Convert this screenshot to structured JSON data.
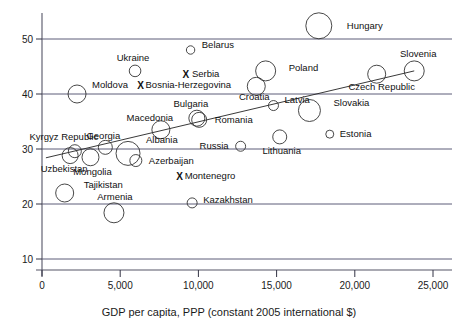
{
  "chart_data": {
    "type": "scatter",
    "title": "",
    "xlabel": "GDP per capita, PPP (constant 2005 international $)",
    "ylabel": "",
    "xlim": [
      0,
      25600
    ],
    "ylim": [
      8,
      54
    ],
    "grid": true,
    "legend": "none",
    "marker_encoding": "bubble size = third variable; X = no size value",
    "xticks": [
      "0",
      "5,000",
      "10,000",
      "15,000",
      "20,000",
      "25,000"
    ],
    "xtick_values": [
      0,
      5000,
      10000,
      15000,
      20000,
      25000
    ],
    "yticks": [
      "10",
      "20",
      "30",
      "40",
      "50"
    ],
    "ytick_values": [
      10,
      20,
      30,
      40,
      50
    ],
    "trendline": {
      "x0": 250,
      "y0": 28.4,
      "x1": 23800,
      "y1": 44.2
    },
    "points": [
      {
        "name": "Hungary",
        "x": 17700,
        "y": 52.4,
        "r": 13.0,
        "marker": "circle",
        "label_dx": 15,
        "label_dy": 3,
        "anchor": "start"
      },
      {
        "name": "Belarus",
        "x": 9500,
        "y": 48.0,
        "r": 4.2,
        "marker": "circle",
        "label_dx": 7,
        "label_dy": -2,
        "anchor": "start"
      },
      {
        "name": "Ukraine",
        "x": 5950,
        "y": 44.2,
        "r": 5.8,
        "marker": "circle",
        "label_dx": -2,
        "label_dy": -10,
        "anchor": "middle"
      },
      {
        "name": "Slovenia",
        "x": 23800,
        "y": 44.2,
        "r": 10.0,
        "marker": "circle",
        "label_dx": 4,
        "label_dy": -14,
        "anchor": "middle"
      },
      {
        "name": "Serbia",
        "x": 9200,
        "y": 43.5,
        "r": 0,
        "marker": "x",
        "label_dx": 6,
        "label_dy": 2,
        "anchor": "start"
      },
      {
        "name": "Poland",
        "x": 14300,
        "y": 44.2,
        "r": 10.0,
        "marker": "circle",
        "label_dx": 13,
        "label_dy": 0,
        "anchor": "start"
      },
      {
        "name": "Czech Republic",
        "x": 21400,
        "y": 43.6,
        "r": 9.0,
        "marker": "circle",
        "label_dx": 5,
        "label_dy": 16,
        "anchor": "middle"
      },
      {
        "name": "Bosnia-Herzegovina",
        "x": 6300,
        "y": 41.6,
        "r": 0,
        "marker": "x",
        "label_dx": 5,
        "label_dy": 3,
        "anchor": "start"
      },
      {
        "name": "Croatia",
        "x": 13700,
        "y": 41.4,
        "r": 9.0,
        "marker": "circle",
        "label_dx": -2,
        "label_dy": 14,
        "anchor": "middle"
      },
      {
        "name": "Moldova",
        "x": 2240,
        "y": 40.0,
        "r": 9.0,
        "marker": "circle",
        "label_dx": 6,
        "label_dy": -6,
        "anchor": "start"
      },
      {
        "name": "Latvia",
        "x": 14800,
        "y": 37.9,
        "r": 5.0,
        "marker": "circle",
        "label_dx": 6,
        "label_dy": -3,
        "anchor": "start"
      },
      {
        "name": "Slovakia",
        "x": 17100,
        "y": 37.0,
        "r": 11.0,
        "marker": "circle",
        "label_dx": 13,
        "label_dy": -5,
        "anchor": "start"
      },
      {
        "name": "Bulgaria",
        "x": 9900,
        "y": 35.6,
        "r": 8.0,
        "marker": "circle",
        "label_dx": -6,
        "label_dy": -11,
        "anchor": "middle"
      },
      {
        "name": "Romania",
        "x": 10050,
        "y": 35.3,
        "r": 7.5,
        "marker": "circle",
        "label_dx": 8,
        "label_dy": 3,
        "anchor": "start"
      },
      {
        "name": "Macedonia",
        "x": 7600,
        "y": 33.5,
        "r": 9.0,
        "marker": "circle",
        "label_dx": -11,
        "label_dy": -9,
        "anchor": "middle"
      },
      {
        "name": "Estonia",
        "x": 18400,
        "y": 32.7,
        "r": 4.0,
        "marker": "circle",
        "label_dx": 6,
        "label_dy": 3,
        "anchor": "start"
      },
      {
        "name": "Lithuania",
        "x": 15200,
        "y": 32.2,
        "r": 7.0,
        "marker": "circle",
        "label_dx": 2,
        "label_dy": 17,
        "anchor": "middle"
      },
      {
        "name": "Russia",
        "x": 12700,
        "y": 30.5,
        "r": 5.0,
        "marker": "circle",
        "label_dx": -7,
        "label_dy": 3,
        "anchor": "end"
      },
      {
        "name": "Georgia",
        "x": 4050,
        "y": 30.3,
        "r": 7.0,
        "marker": "circle",
        "label_dx": -2,
        "label_dy": -8,
        "anchor": "middle"
      },
      {
        "name": "Kyrgyz Republic",
        "x": 2100,
        "y": 29.6,
        "r": 6.5,
        "marker": "circle",
        "label_dx": -11,
        "label_dy": -11,
        "anchor": "middle"
      },
      {
        "name": "Albania",
        "x": 5500,
        "y": 29.2,
        "r": 12.0,
        "marker": "circle",
        "label_dx": 6,
        "label_dy": -10,
        "anchor": "start"
      },
      {
        "name": "Uzbekistan",
        "x": 1800,
        "y": 28.8,
        "r": 8.0,
        "marker": "circle",
        "label_dx": -6,
        "label_dy": 16,
        "anchor": "middle"
      },
      {
        "name": "Mongolia",
        "x": 3100,
        "y": 28.5,
        "r": 8.5,
        "marker": "circle",
        "label_dx": 2,
        "label_dy": 18,
        "anchor": "middle"
      },
      {
        "name": "Azerbaijan",
        "x": 6000,
        "y": 27.9,
        "r": 6.0,
        "marker": "circle",
        "label_dx": 7,
        "label_dy": 3,
        "anchor": "start"
      },
      {
        "name": "Montenegro",
        "x": 8800,
        "y": 25.1,
        "r": 0,
        "marker": "x",
        "label_dx": 5,
        "label_dy": 3,
        "anchor": "start"
      },
      {
        "name": "Tajikistan",
        "x": 1450,
        "y": 22.0,
        "r": 9.0,
        "marker": "circle",
        "label_dx": 10,
        "label_dy": -5,
        "anchor": "start"
      },
      {
        "name": "Kazakhstan",
        "x": 9600,
        "y": 20.2,
        "r": 5.0,
        "marker": "circle",
        "label_dx": 6,
        "label_dy": 0,
        "anchor": "start"
      },
      {
        "name": "Armenia",
        "x": 4600,
        "y": 18.4,
        "r": 10.0,
        "marker": "circle",
        "label_dx": 1,
        "label_dy": -13,
        "anchor": "middle"
      }
    ],
    "colors": {
      "background": "#ffffff",
      "marker_stroke": "#333333",
      "gridline": "#4a4a6a",
      "axis": "#555566",
      "text": "#111111",
      "trendline": "#222222"
    }
  }
}
